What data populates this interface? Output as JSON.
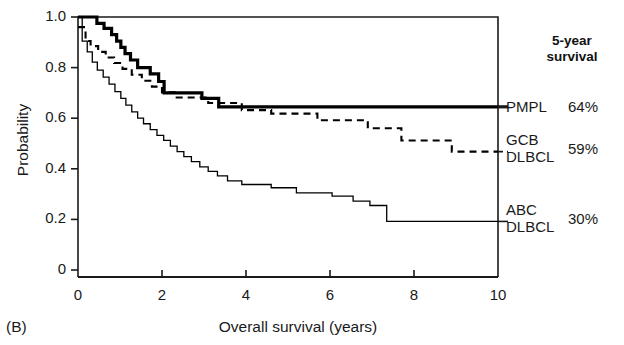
{
  "panel": {
    "tag": "(B)"
  },
  "chart_data": {
    "type": "line",
    "subtype": "kaplan-meier-survival",
    "title": "",
    "xlabel": "Overall survival (years)",
    "ylabel": "Probability",
    "xlim": [
      0,
      10
    ],
    "ylim": [
      0,
      1.0
    ],
    "xticks": [
      0,
      2,
      4,
      6,
      8,
      10
    ],
    "xtick_labels": [
      "0",
      "2",
      "4",
      "6",
      "8",
      "10"
    ],
    "yticks": [
      0,
      0.2,
      0.4,
      0.6,
      0.8,
      1.0
    ],
    "ytick_labels": [
      "0",
      "0.2",
      "0.4",
      "0.6",
      "0.8",
      "1.0"
    ],
    "grid": false,
    "legend_position": "right-outside",
    "legend_header": [
      "5-year",
      "survival"
    ],
    "series": [
      {
        "name": "PMPL",
        "label_lines": [
          "PMPL"
        ],
        "five_year_survival": "64%",
        "style": "solid-bold",
        "color": "#000000",
        "linewidth": 3.2,
        "plateau": 0.645,
        "points": [
          [
            0.0,
            1.0
          ],
          [
            0.45,
            1.0
          ],
          [
            0.45,
            0.975
          ],
          [
            0.62,
            0.975
          ],
          [
            0.62,
            0.955
          ],
          [
            0.8,
            0.955
          ],
          [
            0.8,
            0.93
          ],
          [
            0.92,
            0.93
          ],
          [
            0.92,
            0.905
          ],
          [
            1.02,
            0.905
          ],
          [
            1.02,
            0.88
          ],
          [
            1.12,
            0.88
          ],
          [
            1.12,
            0.855
          ],
          [
            1.25,
            0.855
          ],
          [
            1.25,
            0.83
          ],
          [
            1.42,
            0.83
          ],
          [
            1.42,
            0.8
          ],
          [
            1.72,
            0.8
          ],
          [
            1.72,
            0.775
          ],
          [
            1.92,
            0.775
          ],
          [
            1.92,
            0.745
          ],
          [
            2.05,
            0.745
          ],
          [
            2.05,
            0.7
          ],
          [
            2.95,
            0.7
          ],
          [
            2.95,
            0.678
          ],
          [
            3.35,
            0.678
          ],
          [
            3.35,
            0.645
          ],
          [
            10.0,
            0.645
          ]
        ]
      },
      {
        "name": "GCB DLBCL",
        "label_lines": [
          "GCB",
          "DLBCL"
        ],
        "five_year_survival": "59%",
        "style": "dashed",
        "color": "#000000",
        "linewidth": 2.1,
        "plateau": 0.468,
        "points": [
          [
            0.0,
            0.96
          ],
          [
            0.18,
            0.96
          ],
          [
            0.18,
            0.905
          ],
          [
            0.3,
            0.905
          ],
          [
            0.3,
            0.885
          ],
          [
            0.48,
            0.885
          ],
          [
            0.48,
            0.862
          ],
          [
            0.66,
            0.862
          ],
          [
            0.66,
            0.84
          ],
          [
            0.86,
            0.84
          ],
          [
            0.86,
            0.818
          ],
          [
            1.06,
            0.818
          ],
          [
            1.06,
            0.795
          ],
          [
            1.28,
            0.795
          ],
          [
            1.28,
            0.772
          ],
          [
            1.52,
            0.772
          ],
          [
            1.52,
            0.748
          ],
          [
            1.76,
            0.748
          ],
          [
            1.76,
            0.725
          ],
          [
            2.0,
            0.725
          ],
          [
            2.0,
            0.702
          ],
          [
            2.3,
            0.702
          ],
          [
            2.3,
            0.682
          ],
          [
            3.1,
            0.682
          ],
          [
            3.1,
            0.66
          ],
          [
            3.9,
            0.66
          ],
          [
            3.9,
            0.632
          ],
          [
            4.6,
            0.632
          ],
          [
            4.6,
            0.618
          ],
          [
            5.7,
            0.618
          ],
          [
            5.7,
            0.592
          ],
          [
            6.9,
            0.592
          ],
          [
            6.9,
            0.56
          ],
          [
            7.7,
            0.56
          ],
          [
            7.7,
            0.512
          ],
          [
            8.9,
            0.512
          ],
          [
            8.9,
            0.468
          ],
          [
            10.0,
            0.468
          ]
        ]
      },
      {
        "name": "ABC DLBCL",
        "label_lines": [
          "ABC",
          "DLBCL"
        ],
        "five_year_survival": "30%",
        "style": "solid-thin",
        "color": "#000000",
        "linewidth": 1.3,
        "plateau": 0.192,
        "points": [
          [
            0.0,
            1.0
          ],
          [
            0.1,
            1.0
          ],
          [
            0.1,
            0.905
          ],
          [
            0.22,
            0.905
          ],
          [
            0.22,
            0.862
          ],
          [
            0.34,
            0.862
          ],
          [
            0.34,
            0.822
          ],
          [
            0.46,
            0.822
          ],
          [
            0.46,
            0.79
          ],
          [
            0.6,
            0.79
          ],
          [
            0.6,
            0.762
          ],
          [
            0.74,
            0.762
          ],
          [
            0.74,
            0.735
          ],
          [
            0.88,
            0.735
          ],
          [
            0.88,
            0.705
          ],
          [
            1.02,
            0.705
          ],
          [
            1.02,
            0.678
          ],
          [
            1.14,
            0.678
          ],
          [
            1.14,
            0.652
          ],
          [
            1.28,
            0.652
          ],
          [
            1.28,
            0.625
          ],
          [
            1.42,
            0.625
          ],
          [
            1.42,
            0.6
          ],
          [
            1.56,
            0.6
          ],
          [
            1.56,
            0.578
          ],
          [
            1.72,
            0.578
          ],
          [
            1.72,
            0.555
          ],
          [
            1.88,
            0.555
          ],
          [
            1.88,
            0.532
          ],
          [
            2.04,
            0.532
          ],
          [
            2.04,
            0.512
          ],
          [
            2.2,
            0.512
          ],
          [
            2.2,
            0.49
          ],
          [
            2.36,
            0.49
          ],
          [
            2.36,
            0.468
          ],
          [
            2.52,
            0.468
          ],
          [
            2.52,
            0.448
          ],
          [
            2.7,
            0.448
          ],
          [
            2.7,
            0.428
          ],
          [
            2.9,
            0.428
          ],
          [
            2.9,
            0.408
          ],
          [
            3.1,
            0.408
          ],
          [
            3.1,
            0.39
          ],
          [
            3.32,
            0.39
          ],
          [
            3.32,
            0.372
          ],
          [
            3.56,
            0.372
          ],
          [
            3.56,
            0.352
          ],
          [
            3.9,
            0.352
          ],
          [
            3.9,
            0.338
          ],
          [
            4.6,
            0.338
          ],
          [
            4.6,
            0.325
          ],
          [
            5.2,
            0.325
          ],
          [
            5.2,
            0.305
          ],
          [
            6.05,
            0.305
          ],
          [
            6.05,
            0.292
          ],
          [
            6.55,
            0.292
          ],
          [
            6.55,
            0.272
          ],
          [
            6.95,
            0.272
          ],
          [
            6.95,
            0.255
          ],
          [
            7.35,
            0.255
          ],
          [
            7.35,
            0.192
          ],
          [
            10.0,
            0.192
          ]
        ]
      }
    ]
  }
}
